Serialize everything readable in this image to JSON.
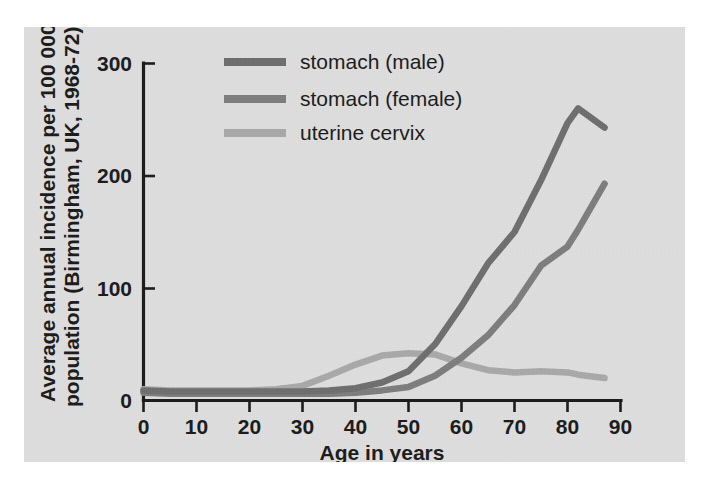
{
  "figure": {
    "panel_bg": "#dfdfdf",
    "page_bg": "#ffffff",
    "axis_color": "#1a1a1a"
  },
  "axes": {
    "x_title": "Age in years",
    "y_title_line1": "Average annual incidence per 100 000",
    "y_title_line2": "population (Birmingham, UK, 1968-72)",
    "x_ticks": [
      "0",
      "10",
      "20",
      "30",
      "40",
      "50",
      "60",
      "70",
      "80",
      "90"
    ],
    "y_ticks": [
      "0",
      "100",
      "200",
      "300"
    ]
  },
  "legend": {
    "position": "top-left-inside",
    "entries": [
      {
        "label": "stomach (male)",
        "color": "#6e6e6e"
      },
      {
        "label": "stomach (female)",
        "color": "#7d7d7d"
      },
      {
        "label": "uterine cervix",
        "color": "#a9a9a9"
      }
    ]
  },
  "chart_data": {
    "type": "line",
    "title": "",
    "subtitle": "",
    "xlabel": "Age in years",
    "ylabel": "Average annual incidence per 100 000 population (Birmingham, UK, 1968-72)",
    "xlim": [
      0,
      90
    ],
    "ylim": [
      0,
      300
    ],
    "x_tick_values": [
      0,
      10,
      20,
      30,
      40,
      50,
      60,
      70,
      80,
      90
    ],
    "y_tick_values": [
      0,
      100,
      200,
      300
    ],
    "grid": false,
    "legend_position": "upper left",
    "x": [
      0,
      5,
      10,
      15,
      20,
      25,
      30,
      35,
      40,
      45,
      50,
      55,
      60,
      65,
      70,
      75,
      80,
      82,
      87
    ],
    "series": [
      {
        "name": "stomach (male)",
        "color": "#6e6e6e",
        "values": [
          9,
          8,
          8,
          8,
          8,
          8,
          8,
          9,
          11,
          16,
          26,
          50,
          84,
          122,
          150,
          196,
          247,
          260,
          243
        ]
      },
      {
        "name": "stomach (female)",
        "color": "#7d7d7d",
        "values": [
          7,
          6,
          6,
          6,
          6,
          6,
          6,
          6,
          7,
          9,
          12,
          22,
          38,
          58,
          85,
          120,
          137,
          152,
          193
        ]
      },
      {
        "name": "uterine cervix",
        "color": "#a9a9a9",
        "values": [
          10,
          9,
          9,
          9,
          9,
          10,
          13,
          22,
          32,
          40,
          42,
          41,
          33,
          27,
          25,
          26,
          25,
          23,
          20
        ]
      }
    ]
  }
}
